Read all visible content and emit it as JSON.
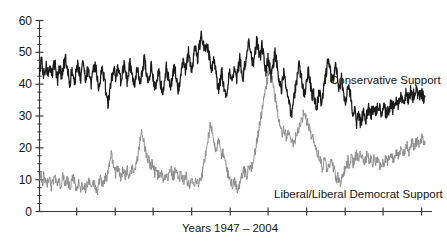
{
  "chart_data": {
    "type": "line",
    "title": "",
    "xlabel": "Years 1947 – 2004",
    "ylabel": "",
    "ylim": [
      0,
      60
    ],
    "yticks": [
      0,
      10,
      20,
      30,
      40,
      50,
      60
    ],
    "ytick_labels": [
      "0",
      "10",
      "20",
      "30",
      "40",
      "50",
      "60"
    ],
    "minor_yticks": [
      2.5,
      5,
      7.5,
      12.5,
      15,
      17.5,
      22.5,
      25,
      27.5,
      32.5,
      35,
      37.5,
      42.5,
      45,
      47.5,
      52.5,
      55,
      57.5
    ],
    "xlim": [
      1947,
      2004
    ],
    "xticks": [
      1952.5,
      1958.2,
      1963.8,
      1969.5,
      1975.2,
      1980.8,
      1986.5,
      1992.2,
      1997.8,
      2003.5
    ],
    "xtick_labels": [
      "",
      "",
      "",
      "",
      "",
      "",
      "",
      "",
      "",
      ""
    ],
    "grid": false,
    "legend_position": "inline-annotation",
    "series": [
      {
        "name": "Conservative Support",
        "color": "#1a1a1a",
        "annotation": "Conservative Support",
        "values": [
          43,
          46,
          49,
          45,
          43,
          44,
          46,
          45,
          44,
          42,
          44,
          46,
          44,
          43,
          45,
          47,
          45,
          43,
          41,
          43,
          46,
          44,
          42,
          44,
          46,
          47,
          48,
          46,
          44,
          42,
          40,
          42,
          44,
          45,
          43,
          41,
          43,
          45,
          47,
          45,
          43,
          42,
          44,
          46,
          45,
          43,
          41,
          43,
          45,
          44,
          42,
          40,
          41,
          43,
          45,
          47,
          45,
          43,
          41,
          39,
          41,
          43,
          45,
          44,
          42,
          40,
          38,
          36,
          34,
          36,
          38,
          40,
          42,
          44,
          46,
          44,
          42,
          44,
          46,
          44,
          42,
          40,
          42,
          44,
          46,
          45,
          43,
          41,
          43,
          45,
          47,
          45,
          43,
          41,
          39,
          41,
          43,
          45,
          44,
          42,
          40,
          42,
          44,
          46,
          48,
          46,
          44,
          42,
          40,
          42,
          44,
          46,
          44,
          42,
          40,
          38,
          40,
          42,
          44,
          43,
          41,
          39,
          37,
          39,
          41,
          43,
          45,
          44,
          42,
          40,
          38,
          40,
          42,
          44,
          46,
          44,
          42,
          40,
          38,
          40,
          42,
          44,
          46,
          48,
          46,
          44,
          46,
          48,
          50,
          48,
          46,
          44,
          46,
          48,
          50,
          52,
          50,
          48,
          50,
          52,
          54,
          56,
          54,
          52,
          50,
          52,
          54,
          52,
          50,
          48,
          46,
          44,
          46,
          48,
          46,
          44,
          42,
          40,
          38,
          40,
          42,
          44,
          42,
          40,
          38,
          36,
          38,
          40,
          42,
          44,
          42,
          40,
          42,
          44,
          46,
          44,
          42,
          44,
          46,
          48,
          46,
          44,
          42,
          44,
          46,
          48,
          50,
          52,
          54,
          52,
          50,
          48,
          46,
          48,
          50,
          52,
          54,
          52,
          50,
          48,
          50,
          52,
          50,
          48,
          46,
          44,
          46,
          48,
          46,
          44,
          42,
          44,
          46,
          48,
          50,
          48,
          46,
          44,
          42,
          40,
          38,
          40,
          42,
          44,
          42,
          40,
          38,
          36,
          34,
          32,
          30,
          32,
          34,
          36,
          38,
          40,
          42,
          44,
          46,
          44,
          42,
          40,
          38,
          36,
          38,
          40,
          42,
          44,
          42,
          40,
          38,
          36,
          38,
          36,
          34,
          32,
          34,
          36,
          38,
          36,
          34,
          36,
          38,
          40,
          42,
          44,
          46,
          48,
          46,
          44,
          42,
          40,
          42,
          44,
          46,
          44,
          42,
          40,
          38,
          40,
          42,
          40,
          38,
          36,
          34,
          36,
          38,
          40,
          38,
          36,
          34,
          32,
          30,
          32,
          30,
          28,
          29,
          30,
          29,
          28,
          29,
          30,
          31,
          30,
          29,
          30,
          31,
          32,
          31,
          30,
          31,
          32,
          33,
          32,
          31,
          32,
          33,
          34,
          33,
          32,
          31,
          32,
          33,
          32,
          31,
          30,
          31,
          32,
          33,
          34,
          33,
          32,
          33,
          34,
          35,
          34,
          33,
          34,
          35,
          36,
          35,
          34,
          35,
          36,
          37,
          36,
          35,
          36,
          37,
          38,
          37,
          36,
          37,
          38,
          39,
          38,
          37,
          36,
          37,
          38,
          37,
          36,
          35,
          36
        ]
      },
      {
        "name": "Liberal/Liberal Democrat Support",
        "color": "#8a8a8a",
        "annotation": "Liberal/Liberal Democrat Support",
        "values": [
          11,
          12,
          10,
          9,
          11,
          10,
          9,
          8,
          10,
          11,
          9,
          8,
          10,
          9,
          11,
          10,
          9,
          8,
          10,
          9,
          8,
          10,
          11,
          9,
          8,
          9,
          10,
          9,
          8,
          9,
          10,
          11,
          10,
          9,
          8,
          7,
          8,
          9,
          8,
          7,
          8,
          9,
          8,
          7,
          8,
          9,
          10,
          9,
          8,
          7,
          8,
          9,
          8,
          7,
          6,
          8,
          9,
          10,
          9,
          8,
          9,
          10,
          11,
          10,
          12,
          14,
          16,
          18,
          16,
          14,
          13,
          12,
          13,
          14,
          13,
          12,
          11,
          12,
          13,
          12,
          11,
          12,
          13,
          12,
          11,
          12,
          13,
          14,
          13,
          14,
          15,
          16,
          18,
          20,
          22,
          24,
          25,
          23,
          21,
          19,
          18,
          17,
          16,
          15,
          14,
          15,
          14,
          13,
          12,
          13,
          12,
          11,
          12,
          13,
          12,
          11,
          10,
          11,
          12,
          11,
          10,
          11,
          12,
          13,
          12,
          11,
          12,
          13,
          12,
          11,
          10,
          11,
          12,
          11,
          10,
          9,
          10,
          11,
          10,
          9,
          8,
          9,
          10,
          9,
          8,
          9,
          10,
          9,
          8,
          9,
          10,
          11,
          12,
          14,
          16,
          18,
          20,
          22,
          24,
          26,
          28,
          26,
          24,
          22,
          20,
          18,
          20,
          22,
          21,
          19,
          17,
          18,
          19,
          17,
          15,
          13,
          12,
          11,
          10,
          9,
          8,
          9,
          10,
          9,
          8,
          7,
          8,
          9,
          10,
          11,
          12,
          13,
          12,
          11,
          12,
          13,
          14,
          13,
          14,
          15,
          16,
          18,
          20,
          22,
          24,
          26,
          28,
          30,
          32,
          34,
          36,
          38,
          40,
          42,
          44,
          46,
          44,
          42,
          40,
          38,
          36,
          34,
          32,
          30,
          28,
          26,
          25,
          24,
          26,
          25,
          24,
          23,
          24,
          25,
          24,
          23,
          22,
          21,
          22,
          23,
          24,
          25,
          26,
          27,
          28,
          29,
          30,
          31,
          30,
          29,
          28,
          27,
          26,
          25,
          24,
          23,
          22,
          21,
          20,
          19,
          18,
          17,
          16,
          15,
          14,
          15,
          16,
          15,
          14,
          13,
          14,
          15,
          16,
          15,
          14,
          13,
          12,
          11,
          10,
          11,
          10,
          9,
          10,
          11,
          12,
          13,
          14,
          15,
          16,
          15,
          16,
          17,
          16,
          15,
          16,
          17,
          18,
          17,
          16,
          17,
          18,
          17,
          16,
          15,
          16,
          17,
          18,
          17,
          16,
          17,
          16,
          15,
          16,
          17,
          16,
          15,
          16,
          15,
          14,
          15,
          16,
          15,
          16,
          17,
          16,
          15,
          16,
          17,
          18,
          17,
          16,
          17,
          18,
          19,
          18,
          17,
          18,
          19,
          20,
          19,
          18,
          19,
          20,
          21,
          20,
          19,
          20,
          21,
          22,
          21,
          20,
          21,
          22,
          23,
          22,
          21,
          22,
          23,
          22,
          21,
          22
        ]
      }
    ]
  },
  "annotations": {
    "conservative_label": "Conservative Support",
    "liberal_label": "Liberal/Liberal Democrat Support"
  },
  "axis": {
    "x_title": "Years 1947 – 2004"
  },
  "colors": {
    "conservative": "#1a1a1a",
    "liberal": "#8a8a8a",
    "axis": "#3a3a3a",
    "background": "#ffffff"
  }
}
